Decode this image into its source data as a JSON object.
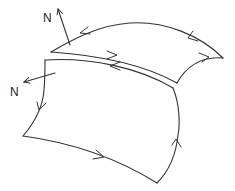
{
  "diagram": {
    "type": "surface-orientation",
    "surfaces": [
      {
        "id": "upper",
        "normal_label": "N"
      },
      {
        "id": "lower",
        "normal_label": "N"
      }
    ],
    "labels": {
      "upper_normal": "N",
      "lower_normal": "N"
    },
    "colors": {
      "stroke": "#333333",
      "background": "#ffffff"
    }
  }
}
